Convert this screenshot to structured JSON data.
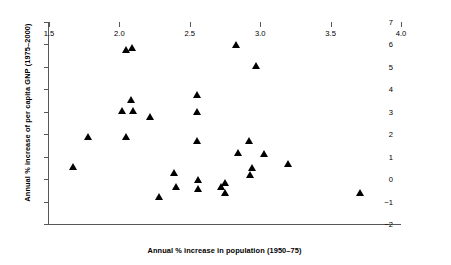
{
  "chart_data": {
    "type": "scatter",
    "title": "",
    "xlabel": "Annual % increase in population (1950–75)",
    "ylabel": "Annual % increase of per capita GNP (1975–2000)",
    "xlim": [
      1.5,
      4.0
    ],
    "ylim": [
      -2,
      7
    ],
    "xticks": [
      "1.5",
      "2.0",
      "2.5",
      "3.0",
      "3.5",
      "4.0"
    ],
    "xtick_values": [
      1.5,
      2.0,
      2.5,
      3.0,
      3.5,
      4.0
    ],
    "yticks": [
      "7",
      "6",
      "5",
      "4",
      "3",
      "2",
      "1",
      "0",
      "−1",
      "−2"
    ],
    "ytick_values": [
      7,
      6,
      5,
      4,
      3,
      2,
      1,
      0,
      -1,
      -2
    ],
    "grid": false,
    "legend": null,
    "marker": "triangle",
    "marker_color": "#000000",
    "points": [
      {
        "x": 1.67,
        "y": 0.55
      },
      {
        "x": 1.78,
        "y": 1.9
      },
      {
        "x": 2.02,
        "y": 3.05
      },
      {
        "x": 2.05,
        "y": 5.75
      },
      {
        "x": 2.05,
        "y": 1.88
      },
      {
        "x": 2.08,
        "y": 3.55
      },
      {
        "x": 2.09,
        "y": 5.85
      },
      {
        "x": 2.1,
        "y": 3.06
      },
      {
        "x": 2.22,
        "y": 2.8
      },
      {
        "x": 2.28,
        "y": -0.78
      },
      {
        "x": 2.39,
        "y": 0.28
      },
      {
        "x": 2.4,
        "y": -0.34
      },
      {
        "x": 2.55,
        "y": 3.76
      },
      {
        "x": 2.55,
        "y": 3.0
      },
      {
        "x": 2.55,
        "y": 1.7
      },
      {
        "x": 2.56,
        "y": -0.04
      },
      {
        "x": 2.56,
        "y": -0.43
      },
      {
        "x": 2.72,
        "y": -0.32
      },
      {
        "x": 2.75,
        "y": -0.14
      },
      {
        "x": 2.75,
        "y": -0.61
      },
      {
        "x": 2.83,
        "y": 6.0
      },
      {
        "x": 2.84,
        "y": 1.18
      },
      {
        "x": 2.92,
        "y": 1.72
      },
      {
        "x": 2.93,
        "y": 0.18
      },
      {
        "x": 2.94,
        "y": 0.53
      },
      {
        "x": 2.97,
        "y": 5.06
      },
      {
        "x": 3.03,
        "y": 1.15
      },
      {
        "x": 3.2,
        "y": 0.69
      },
      {
        "x": 3.71,
        "y": -0.62
      }
    ]
  }
}
